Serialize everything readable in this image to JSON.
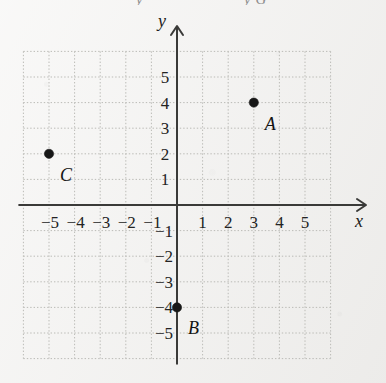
{
  "figure": {
    "background_color": "#f2f1ef",
    "ink_color": "#232323",
    "grid_color": "#b9b9b4",
    "axis_color": "#3a3a38",
    "point_color": "#171717"
  },
  "cropped_header": {
    "fragment_left": "y",
    "fragment_right": "y G"
  },
  "axes": {
    "x_name": "x",
    "y_name": "y",
    "x_arrow_icon": "arrow-right-icon",
    "y_arrow_icon": "arrow-up-icon"
  },
  "chart_data": {
    "type": "scatter",
    "title": "",
    "xlabel": "x",
    "ylabel": "y",
    "xlim": [
      -6,
      6
    ],
    "ylim": [
      -6,
      6
    ],
    "grid": true,
    "grid_style": "dotted",
    "legend": "none",
    "x_tick_labels": [
      "−5",
      "−4",
      "−3",
      "−2",
      "−1",
      "1",
      "2",
      "3",
      "4",
      "5"
    ],
    "x_tick_values": [
      -5,
      -4,
      -3,
      -2,
      -1,
      1,
      2,
      3,
      4,
      5
    ],
    "y_tick_labels": [
      "5",
      "4",
      "3",
      "2",
      "1",
      "−1",
      "−2",
      "−3",
      "−4",
      "−5"
    ],
    "y_tick_values": [
      5,
      4,
      3,
      2,
      1,
      -1,
      -2,
      -3,
      -4,
      -5
    ],
    "points": [
      {
        "label": "A",
        "x": 3,
        "y": 4,
        "label_dx": 11,
        "label_dy": 12
      },
      {
        "label": "B",
        "x": 0,
        "y": -4,
        "label_dx": 11,
        "label_dy": 12
      },
      {
        "label": "C",
        "x": -5,
        "y": 2,
        "label_dx": 11,
        "label_dy": 12
      }
    ]
  }
}
